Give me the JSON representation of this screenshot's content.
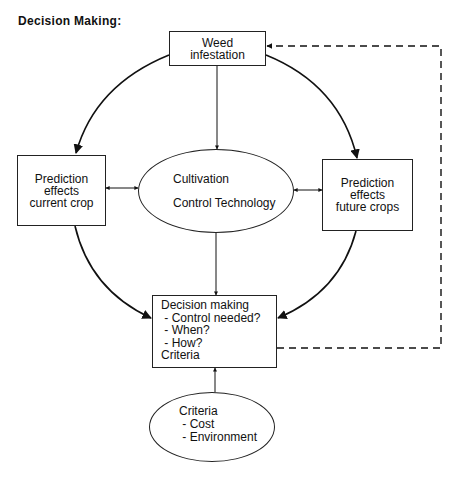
{
  "title": "Decision Making:",
  "nodes": {
    "weed": {
      "lines": [
        "Weed",
        "infestation"
      ]
    },
    "current": {
      "lines": [
        "Prediction",
        "effects",
        "current crop"
      ]
    },
    "future": {
      "lines": [
        "Prediction",
        "effects",
        "future crops"
      ]
    },
    "cultivation": {
      "lines": [
        "Cultivation",
        "Control Technology"
      ]
    },
    "decision": {
      "lines": [
        "Decision making",
        " - Control needed?",
        " - When?",
        " - How?",
        "Criteria"
      ]
    },
    "criteria": {
      "lines": [
        "Criteria",
        " - Cost",
        " - Environment"
      ]
    }
  },
  "colors": {
    "stroke": "#111111",
    "background": "#ffffff"
  }
}
